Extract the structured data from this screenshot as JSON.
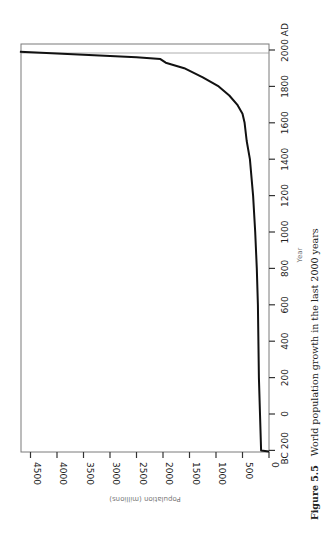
{
  "chart_data": {
    "type": "line",
    "title": "World population growth in the last 2000 years",
    "figure_label": "Figure 5.5",
    "xlabel": "Year",
    "ylabel": "Population (millions)",
    "orientation": "rotated 90° counter-clockwise on page",
    "x_ticks": [
      "BC 200",
      "0",
      "200",
      "400",
      "600",
      "800",
      "1000",
      "1200",
      "1400",
      "1600",
      "1800",
      "2000 AD"
    ],
    "x_tick_values": [
      -200,
      0,
      200,
      400,
      600,
      800,
      1000,
      1200,
      1400,
      1600,
      1800,
      2000
    ],
    "y_ticks": [
      "0",
      "500",
      "1000",
      "1500",
      "2000",
      "2500",
      "3000",
      "3500",
      "4000",
      "4500"
    ],
    "y_tick_values": [
      0,
      500,
      1000,
      1500,
      2000,
      2500,
      3000,
      3500,
      4000,
      4500
    ],
    "xlim": [
      -200,
      2000
    ],
    "ylim": [
      0,
      4500
    ],
    "grid": false,
    "legend": null,
    "series": [
      {
        "name": "World population",
        "x": [
          -200,
          0,
          200,
          400,
          600,
          800,
          1000,
          1200,
          1400,
          1500,
          1600,
          1650,
          1700,
          1750,
          1800,
          1850,
          1900,
          1930,
          1950,
          1960,
          1970,
          1980,
          1990
        ],
        "values": [
          150,
          170,
          190,
          200,
          210,
          230,
          260,
          300,
          360,
          420,
          460,
          500,
          600,
          750,
          950,
          1250,
          1600,
          1950,
          2050,
          2500,
          3200,
          4000,
          4700
        ]
      }
    ]
  },
  "caption": {
    "label": "Figure 5.5",
    "text": "World population growth in the last 2000 years"
  }
}
